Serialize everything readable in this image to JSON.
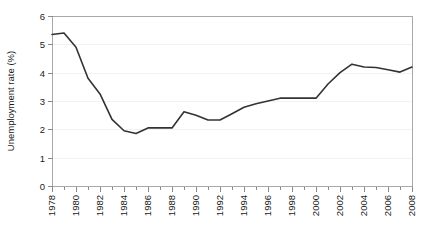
{
  "chart_data": {
    "type": "line",
    "title": "",
    "xlabel": "",
    "ylabel": "Unemployment rate (%)",
    "xlim": [
      1978,
      2008
    ],
    "ylim": [
      0,
      6
    ],
    "grid": true,
    "legend": "none",
    "y_ticks": [
      "0",
      "1",
      "2",
      "3",
      "4",
      "5",
      "6"
    ],
    "y_tick_values": [
      0,
      1,
      2,
      3,
      4,
      5,
      6
    ],
    "x_tick_labels": [
      "1978",
      "1980",
      "1982",
      "1984",
      "1986",
      "1988",
      "1990",
      "1992",
      "1994",
      "1996",
      "1998",
      "2000",
      "2002",
      "2004",
      "2006",
      "2008"
    ],
    "x_tick_values": [
      1978,
      1980,
      1982,
      1984,
      1986,
      1988,
      1990,
      1992,
      1994,
      1996,
      1998,
      2000,
      2002,
      2004,
      2006,
      2008
    ],
    "x": [
      1978,
      1979,
      1980,
      1981,
      1982,
      1983,
      1984,
      1985,
      1986,
      1987,
      1988,
      1989,
      1990,
      1991,
      1992,
      1993,
      1994,
      1995,
      1996,
      1997,
      1998,
      1999,
      2000,
      2001,
      2002,
      2003,
      2004,
      2005,
      2006,
      2007,
      2008
    ],
    "values": [
      5.35,
      5.4,
      4.9,
      3.8,
      3.25,
      2.35,
      1.95,
      1.85,
      2.05,
      2.05,
      2.05,
      2.62,
      2.5,
      2.33,
      2.33,
      2.55,
      2.78,
      2.9,
      3.0,
      3.1,
      3.1,
      3.1,
      3.1,
      3.6,
      4.0,
      4.3,
      4.2,
      4.18,
      4.1,
      4.02,
      4.2
    ],
    "series_name": "Unemployment rate",
    "line_color": "#333333",
    "frame_color": "#a8a8a8",
    "grid_color": "#f2f2f2"
  }
}
